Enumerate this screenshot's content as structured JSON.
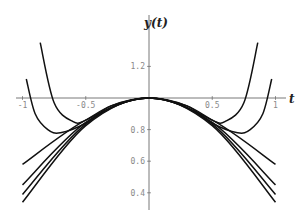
{
  "chart_data": {
    "type": "line",
    "title": "",
    "xlabel": "t",
    "ylabel": "y(t)",
    "xlim": [
      -1.0,
      1.0
    ],
    "ylim": [
      0.3,
      1.35
    ],
    "x_axis_crosses_y_at": 1.0,
    "x_ticks": [
      "-1",
      "-0.5",
      "0.5",
      "1"
    ],
    "y_ticks": [
      "1.2",
      "0.8",
      "0.6",
      "0.4"
    ],
    "grid": false,
    "legend": null,
    "series": [
      {
        "name": "curve-1 (steep U)",
        "x": [
          -0.86,
          -0.75,
          -0.6,
          -0.5,
          -0.3,
          0,
          0.3,
          0.5,
          0.6,
          0.75,
          0.86
        ],
        "values": [
          1.35,
          0.97,
          0.85,
          0.86,
          0.95,
          1.0,
          0.95,
          0.86,
          0.85,
          0.97,
          1.35
        ]
      },
      {
        "name": "curve-2 (U)",
        "x": [
          -0.97,
          -0.9,
          -0.8,
          -0.7,
          -0.5,
          -0.3,
          0,
          0.3,
          0.5,
          0.7,
          0.8,
          0.9,
          0.97
        ],
        "values": [
          1.12,
          0.9,
          0.8,
          0.78,
          0.84,
          0.95,
          1.0,
          0.95,
          0.84,
          0.78,
          0.8,
          0.9,
          1.12
        ]
      },
      {
        "name": "curve-3",
        "x": [
          -1,
          -0.5,
          0,
          0.5,
          1
        ],
        "values": [
          0.58,
          0.86,
          1.0,
          0.86,
          0.58
        ]
      },
      {
        "name": "curve-4",
        "x": [
          -1,
          -0.5,
          0,
          0.5,
          1
        ],
        "values": [
          0.45,
          0.845,
          1.0,
          0.845,
          0.45
        ]
      },
      {
        "name": "curve-5",
        "x": [
          -1,
          -0.5,
          0,
          0.5,
          1
        ],
        "values": [
          0.39,
          0.835,
          1.0,
          0.835,
          0.39
        ]
      },
      {
        "name": "curve-6",
        "x": [
          -1,
          -0.5,
          0,
          0.5,
          1
        ],
        "values": [
          0.34,
          0.825,
          1.0,
          0.825,
          0.34
        ]
      }
    ]
  },
  "axes": {
    "x_label": "t",
    "y_label": "y(t)"
  }
}
